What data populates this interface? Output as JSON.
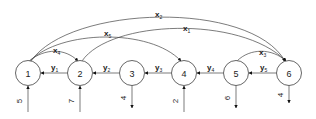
{
  "diagram": {
    "type": "flow-network",
    "nodes": [
      {
        "id": "1",
        "label": "1",
        "cx": 28,
        "cy": 73
      },
      {
        "id": "2",
        "label": "2",
        "cx": 80,
        "cy": 73
      },
      {
        "id": "3",
        "label": "3",
        "cx": 132,
        "cy": 73
      },
      {
        "id": "4",
        "label": "4",
        "cx": 184,
        "cy": 73
      },
      {
        "id": "5",
        "label": "5",
        "cx": 236,
        "cy": 73
      },
      {
        "id": "6",
        "label": "6",
        "cx": 289,
        "cy": 73
      }
    ],
    "y_edges": [
      {
        "var": "y",
        "sub": "1",
        "from": "2",
        "to": "1"
      },
      {
        "var": "y",
        "sub": "2",
        "from": "3",
        "to": "2"
      },
      {
        "var": "y",
        "sub": "3",
        "from": "4",
        "to": "3"
      },
      {
        "var": "y",
        "sub": "4",
        "from": "5",
        "to": "4"
      },
      {
        "var": "y",
        "sub": "5",
        "from": "6",
        "to": "5"
      }
    ],
    "x_edges": [
      {
        "var": "x",
        "sub": "1",
        "from": "2",
        "to": "6"
      },
      {
        "var": "x",
        "sub": "2",
        "from": "1",
        "to": "6"
      },
      {
        "var": "x",
        "sub": "3",
        "from": "5",
        "to": "6"
      },
      {
        "var": "x",
        "sub": "4",
        "from": "1",
        "to": "2"
      },
      {
        "var": "x",
        "sub": "5",
        "from": "1",
        "to": "4"
      }
    ],
    "supplies": [
      {
        "node": "1",
        "value": "5",
        "direction": "in"
      },
      {
        "node": "2",
        "value": "7",
        "direction": "in"
      },
      {
        "node": "4",
        "value": "2",
        "direction": "in"
      }
    ],
    "demands": [
      {
        "node": "3",
        "value": "4",
        "direction": "out"
      },
      {
        "node": "5",
        "value": "6",
        "direction": "out"
      },
      {
        "node": "6",
        "value": "4",
        "direction": "out"
      }
    ],
    "labels": {
      "y1": "y",
      "y1_sub": "1",
      "y2": "y",
      "y2_sub": "2",
      "y3": "y",
      "y3_sub": "3",
      "y4": "y",
      "y4_sub": "4",
      "y5": "y",
      "y5_sub": "5",
      "x1": "x",
      "x1_sub": "1",
      "x2": "x",
      "x2_sub": "2",
      "x3": "x",
      "x3_sub": "3",
      "x4": "x",
      "x4_sub": "4",
      "x5": "x",
      "x5_sub": "5",
      "s1": "5",
      "s2": "7",
      "s4": "2",
      "d3": "4",
      "d5": "6",
      "d6": "4"
    }
  }
}
